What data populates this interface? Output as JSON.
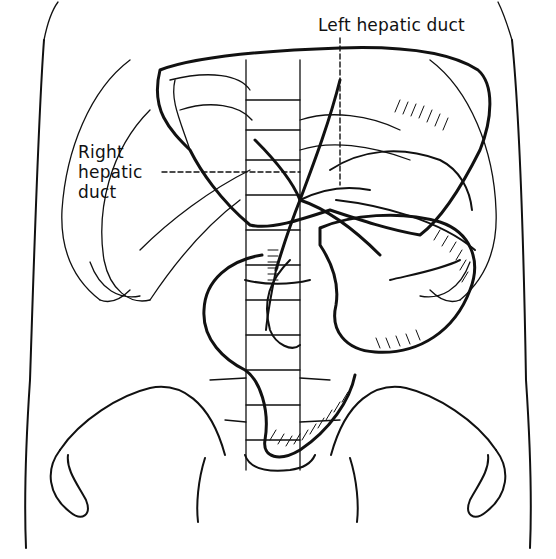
{
  "figure": {
    "type": "anatomical line illustration",
    "labels": [
      {
        "id": "left_hepatic_duct",
        "text": "Left hepatic duct",
        "lines": [
          "Left hepatic duct"
        ]
      },
      {
        "id": "right_hepatic_duct",
        "text": "Right hepatic duct",
        "lines": [
          "Right",
          "hepatic",
          "duct"
        ]
      }
    ],
    "colors": {
      "ink": "#111111",
      "background": "#ffffff"
    }
  }
}
